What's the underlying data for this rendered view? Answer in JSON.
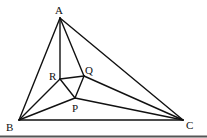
{
  "diagram": {
    "type": "geometry",
    "points": {
      "A": {
        "label": "A",
        "x": 60,
        "y": 18
      },
      "B": {
        "label": "B",
        "x": 19,
        "y": 120
      },
      "C": {
        "label": "C",
        "x": 183,
        "y": 120
      },
      "R": {
        "label": "R",
        "x": 60,
        "y": 79
      },
      "Q": {
        "label": "Q",
        "x": 84,
        "y": 76
      },
      "P": {
        "label": "P",
        "x": 75,
        "y": 98
      }
    },
    "segments": [
      [
        "A",
        "B"
      ],
      [
        "A",
        "C"
      ],
      [
        "B",
        "C"
      ],
      [
        "A",
        "R"
      ],
      [
        "A",
        "Q"
      ],
      [
        "B",
        "R"
      ],
      [
        "B",
        "P"
      ],
      [
        "C",
        "Q"
      ],
      [
        "C",
        "P"
      ],
      [
        "R",
        "Q"
      ],
      [
        "Q",
        "P"
      ],
      [
        "P",
        "R"
      ]
    ],
    "labels": {
      "A": "A",
      "B": "B",
      "C": "C",
      "R": "R",
      "Q": "Q",
      "P": "P"
    },
    "colors": {
      "stroke": "#111111",
      "background": "#ffffff",
      "rule": "#444444"
    }
  }
}
